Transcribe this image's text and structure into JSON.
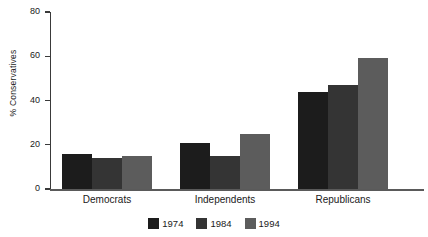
{
  "chart_data": {
    "type": "bar",
    "title": "",
    "xlabel": "",
    "ylabel": "% Conservatives",
    "categories": [
      "Democrats",
      "Independents",
      "Republicans"
    ],
    "series": [
      {
        "name": "1974",
        "color": "#1c1c1c",
        "values": [
          16,
          21,
          44
        ]
      },
      {
        "name": "1984",
        "color": "#343434",
        "values": [
          14,
          15,
          47
        ]
      },
      {
        "name": "1994",
        "color": "#5c5c5c",
        "values": [
          15,
          25,
          59
        ]
      }
    ],
    "ylim": [
      0,
      80
    ],
    "yticks": [
      0,
      20,
      40,
      60,
      80
    ],
    "ytick_labels": [
      "0",
      "20",
      "40",
      "60",
      "80"
    ],
    "grid": false,
    "legend_position": "bottom-center"
  },
  "axes": {
    "y_axis_title": "% Conservatives"
  },
  "legend": {
    "entries": [
      {
        "label": "1974",
        "color": "#1c1c1c"
      },
      {
        "label": "1984",
        "color": "#343434"
      },
      {
        "label": "1994",
        "color": "#5c5c5c"
      }
    ]
  }
}
